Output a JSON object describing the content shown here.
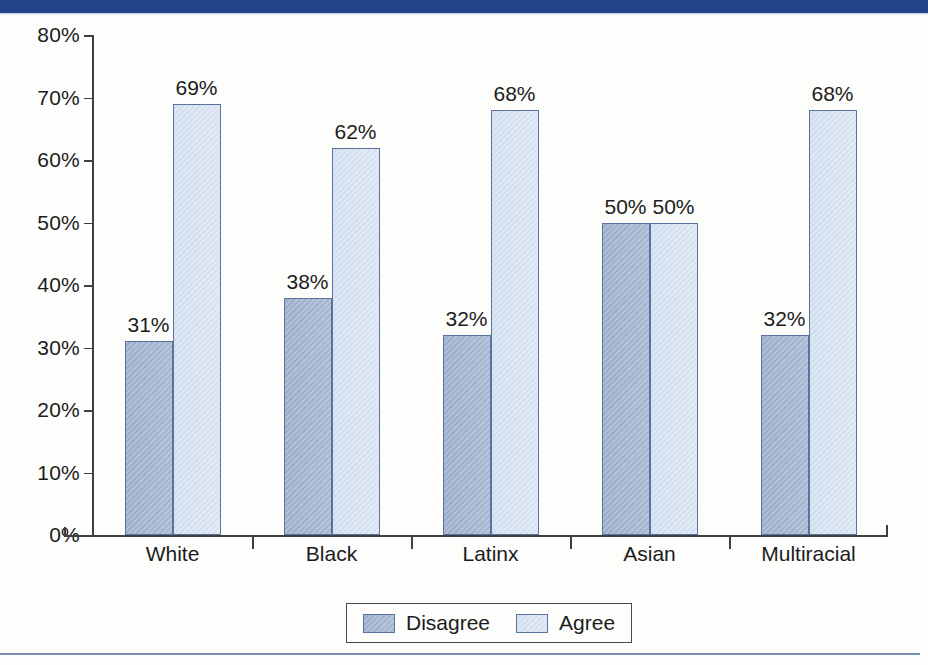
{
  "chart_data": {
    "type": "bar",
    "title": "",
    "subtitle": "",
    "xlabel": "",
    "ylabel": "",
    "categories": [
      "White",
      "Black",
      "Latinx",
      "Asian",
      "Multiracial"
    ],
    "series": [
      {
        "name": "Disagree",
        "values": [
          31,
          38,
          32,
          50,
          32
        ],
        "color": "#a3b5d0"
      },
      {
        "name": "Agree",
        "values": [
          69,
          62,
          68,
          50,
          68
        ],
        "color": "#d6e2f2"
      }
    ],
    "value_labels": [
      [
        "31%",
        "69%"
      ],
      [
        "38%",
        "62%"
      ],
      [
        "32%",
        "68%"
      ],
      [
        "50%",
        "50%"
      ],
      [
        "32%",
        "68%"
      ]
    ],
    "ylim": [
      0,
      80
    ],
    "ytick_values": [
      0,
      10,
      20,
      30,
      40,
      50,
      60,
      70,
      80
    ],
    "ytick_labels": [
      "0%",
      "10%",
      "20%",
      "30%",
      "40%",
      "50%",
      "60%",
      "70%",
      "80%"
    ],
    "grid": false,
    "legend_position": "bottom-center",
    "legend_entries": [
      "Disagree",
      "Agree"
    ],
    "value_label_suffix": "%"
  },
  "legend": {
    "disagree_label": "Disagree",
    "agree_label": "Agree"
  },
  "decor": {
    "top_rule_color": "#22458a",
    "bottom_rule_color": "#5f79a8",
    "axis_color": "#3f3f3f",
    "bar_border_color": "#5a729e"
  }
}
